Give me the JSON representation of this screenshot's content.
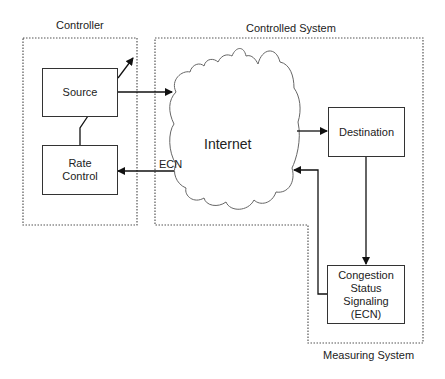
{
  "regions": {
    "controller": "Controller",
    "controlled_system": "Controlled System",
    "measuring_system": "Measuring System"
  },
  "nodes": {
    "source": "Source",
    "rate_control_line1": "Rate",
    "rate_control_line2": "Control",
    "internet": "Internet",
    "destination": "Destination",
    "congestion_line1": "Congestion",
    "congestion_line2": "Status",
    "congestion_line3": "Signaling",
    "congestion_line4": "(ECN)"
  },
  "edges": {
    "ecn_label": "ECN"
  },
  "colors": {
    "line": "#222222",
    "dotted": "#555555",
    "cloud": "#666666"
  }
}
